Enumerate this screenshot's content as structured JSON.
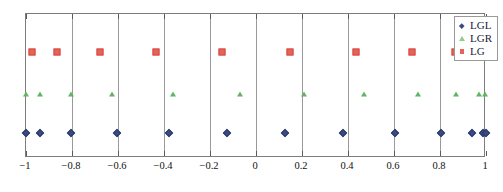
{
  "chart_data": {
    "type": "scatter",
    "title": "",
    "xlabel": "",
    "ylabel": "",
    "xlim": [
      -1,
      1
    ],
    "ylim": [
      0,
      1
    ],
    "grid": true,
    "legend_position": "top-right",
    "xticks": [
      -1,
      -0.8,
      -0.6,
      -0.4,
      -0.2,
      0,
      0.2,
      0.4,
      0.6,
      0.8,
      1
    ],
    "xticklabels": [
      "−1",
      "−0.8",
      "−0.6",
      "−0.4",
      "−0.2",
      "0",
      "0.2",
      "0.4",
      "0.6",
      "0.8",
      "1"
    ],
    "yticks": [],
    "yticklabels": [],
    "series": [
      {
        "name": "LGL",
        "marker": "diamond",
        "color": "#3c4a82",
        "row_y": 0.175,
        "count": 13,
        "x": [
          -1,
          -0.9391,
          -0.8039,
          -0.6057,
          -0.3762,
          -0.1252,
          0.1252,
          0.3762,
          0.6057,
          0.8039,
          0.9391,
          0.9891,
          1
        ]
      },
      {
        "name": "LGR",
        "marker": "triangle",
        "color": "#63b463",
        "row_y": 0.446,
        "count": 12,
        "x": [
          -1,
          -0.9371,
          -0.8042,
          -0.628,
          -0.3598,
          -0.0716,
          0.2101,
          0.4703,
          0.7022,
          0.8706,
          0.97,
          0.996
        ]
      },
      {
        "name": "LG",
        "marker": "square",
        "color": "#e8625a",
        "row_y": 0.734,
        "count": 10,
        "x": [
          -0.9739,
          -0.8651,
          -0.6794,
          -0.4334,
          -0.1489,
          0.1489,
          0.4334,
          0.6794,
          0.8651,
          0.9739
        ]
      }
    ]
  },
  "legend": {
    "items": [
      {
        "label": "LGL",
        "symbol": "diamond-marker"
      },
      {
        "label": "LGR",
        "symbol": "triangle-marker"
      },
      {
        "label": "LG",
        "symbol": "square-marker"
      }
    ]
  }
}
